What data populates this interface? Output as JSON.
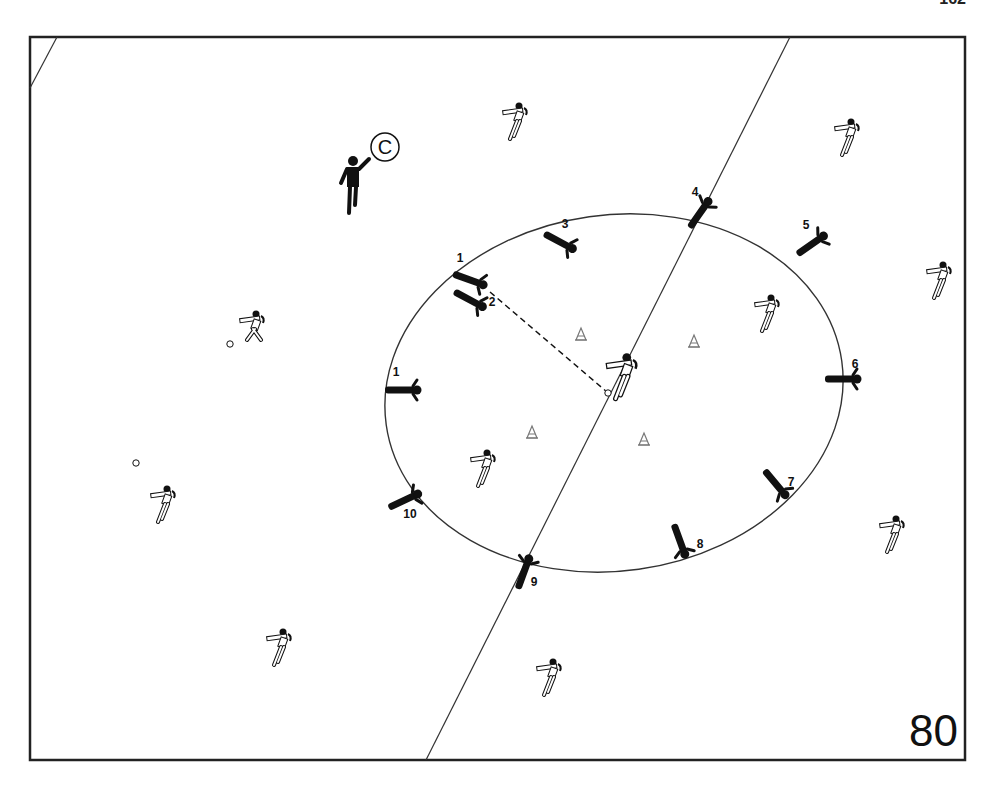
{
  "page": {
    "header_fragment": "162",
    "page_number": "80"
  },
  "frame": {
    "x": 30,
    "y": 37,
    "w": 935,
    "h": 723,
    "stroke": "#222"
  },
  "field": {
    "halfway_line": {
      "x1": 790,
      "y1": 37,
      "x2": 426,
      "y2": 760
    },
    "corner_line": {
      "x1": 57,
      "y1": 37,
      "x2": 30,
      "y2": 88
    },
    "circle": {
      "cx": 614,
      "cy": 393,
      "rx": 230,
      "ry": 178,
      "rotate": -8
    }
  },
  "coach": {
    "label": "C",
    "x": 353,
    "y": 185,
    "label_x": 385,
    "label_y": 147
  },
  "pass": {
    "from": [
      490,
      292
    ],
    "to": [
      607,
      392
    ]
  },
  "cones": [
    {
      "x": 581,
      "y": 334
    },
    {
      "x": 694,
      "y": 341
    },
    {
      "x": 532,
      "y": 432
    },
    {
      "x": 644,
      "y": 439
    }
  ],
  "balls": [
    {
      "x": 230,
      "y": 344
    },
    {
      "x": 136,
      "y": 463
    },
    {
      "x": 608,
      "y": 393
    }
  ],
  "ring_players": [
    {
      "num": "1",
      "x": 470,
      "y": 280,
      "angle": 20,
      "num_x": 460,
      "num_y": 262
    },
    {
      "num": "2",
      "x": 470,
      "y": 300,
      "angle": 28,
      "num_x": 492,
      "num_y": 306
    },
    {
      "num": "3",
      "x": 560,
      "y": 242,
      "angle": 28,
      "num_x": 565,
      "num_y": 228
    },
    {
      "num": "4",
      "x": 700,
      "y": 213,
      "angle": -55,
      "num_x": 695,
      "num_y": 196
    },
    {
      "num": "5",
      "x": 812,
      "y": 244,
      "angle": -35,
      "num_x": 806,
      "num_y": 229
    },
    {
      "num": "6",
      "x": 843,
      "y": 379,
      "angle": 0,
      "num_x": 855,
      "num_y": 368
    },
    {
      "num": "7",
      "x": 776,
      "y": 484,
      "angle": 50,
      "num_x": 791,
      "num_y": 486
    },
    {
      "num": "8",
      "x": 680,
      "y": 541,
      "angle": 70,
      "num_x": 700,
      "num_y": 548
    },
    {
      "num": "9",
      "x": 524,
      "y": 572,
      "angle": -70,
      "num_x": 534,
      "num_y": 586
    },
    {
      "num": "1",
      "x": 403,
      "y": 390,
      "angle": 0,
      "num_x": 396,
      "num_y": 376
    },
    {
      "num": "10",
      "x": 405,
      "y": 500,
      "angle": -25,
      "num_x": 410,
      "num_y": 518
    }
  ],
  "outfield_players": [
    {
      "x": 516,
      "y": 120
    },
    {
      "x": 848,
      "y": 136
    },
    {
      "x": 940,
      "y": 279
    },
    {
      "x": 768,
      "y": 312
    },
    {
      "x": 623,
      "y": 375,
      "center": true
    },
    {
      "x": 253,
      "y": 328,
      "bent": true
    },
    {
      "x": 484,
      "y": 467
    },
    {
      "x": 164,
      "y": 503
    },
    {
      "x": 893,
      "y": 533
    },
    {
      "x": 280,
      "y": 646
    },
    {
      "x": 550,
      "y": 676
    }
  ],
  "colors": {
    "ink": "#111111",
    "line": "#333333",
    "paper": "#ffffff",
    "cone": "#777777"
  }
}
